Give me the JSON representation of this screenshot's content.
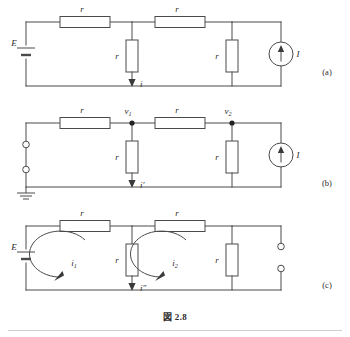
{
  "figure": {
    "caption": "図 2.8",
    "panels": [
      {
        "id": "a",
        "label": "(a)"
      },
      {
        "id": "b",
        "label": "(b)"
      },
      {
        "id": "c",
        "label": "(c)"
      }
    ]
  },
  "panel_a": {
    "label": "(a)",
    "source_label": "E",
    "current_source_label": "I",
    "resistor_top_left": "r",
    "resistor_top_right": "r",
    "resistor_middle": "r",
    "resistor_right": "r",
    "branch_current": "i"
  },
  "panel_b": {
    "label": "(b)",
    "current_source_label": "I",
    "resistor_top_left": "r",
    "resistor_top_right": "r",
    "resistor_middle": "r",
    "resistor_right": "r",
    "node_1": "v",
    "node_1_sub": "1",
    "node_2": "v",
    "node_2_sub": "2",
    "branch_current": "i′"
  },
  "panel_c": {
    "label": "(c)",
    "source_label": "E",
    "resistor_top_left": "r",
    "resistor_top_right": "r",
    "resistor_middle": "r",
    "resistor_right": "r",
    "mesh_1": "i",
    "mesh_1_sub": "1",
    "mesh_2": "i",
    "mesh_2_sub": "2",
    "branch_current": "i″"
  },
  "colors": {
    "wire": "#4a4a4a",
    "node": "#222222",
    "text": "#2b2b2b",
    "background": "#ffffff"
  }
}
